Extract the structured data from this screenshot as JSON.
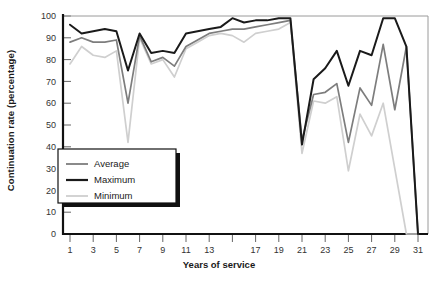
{
  "chart_data": {
    "type": "line",
    "title": "",
    "xlabel": "Years of service",
    "ylabel": "Continuation rate (percentage)",
    "xlim": [
      0,
      32
    ],
    "ylim": [
      0,
      100
    ],
    "grid": false,
    "legend_position": "inside-lower-left",
    "y_ticks": [
      0,
      10,
      20,
      30,
      40,
      50,
      60,
      70,
      80,
      90,
      100
    ],
    "y_tick_labels": [
      "0",
      "10",
      "20",
      "30",
      "40",
      "50",
      "60",
      "70",
      "80",
      "90",
      "100"
    ],
    "x_ticks": [
      1,
      3,
      5,
      7,
      9,
      11,
      13,
      15,
      17,
      19,
      21,
      23,
      25,
      27,
      29,
      31
    ],
    "x_tick_labels": [
      "1",
      "3",
      "5",
      "7",
      "9",
      "11",
      "13",
      "",
      "17",
      "19",
      "21",
      "23",
      "25",
      "27",
      "29",
      "31"
    ],
    "x": [
      1,
      2,
      3,
      4,
      5,
      6,
      7,
      8,
      9,
      10,
      11,
      12,
      13,
      14,
      15,
      16,
      17,
      18,
      19,
      20,
      21,
      22,
      23,
      24,
      25,
      26,
      27,
      28,
      29,
      30,
      31
    ],
    "series": [
      {
        "name": "Average",
        "color": "#7d7d7d",
        "values": [
          88,
          90,
          88,
          88,
          89,
          60,
          91,
          79,
          81,
          77,
          86,
          89,
          92,
          93,
          94,
          94,
          95,
          96,
          97,
          98,
          43,
          64,
          65,
          69,
          42,
          67,
          59,
          87,
          57,
          86,
          0
        ]
      },
      {
        "name": "Maximum",
        "color": "#1a1a1a",
        "values": [
          96,
          92,
          93,
          94,
          93,
          75,
          92,
          83,
          84,
          83,
          92,
          93,
          94,
          95,
          99,
          97,
          98,
          98,
          99,
          99,
          41,
          71,
          76,
          84,
          68,
          84,
          82,
          99,
          99,
          86,
          0
        ]
      },
      {
        "name": "Minimum",
        "color": "#cfcfcf",
        "values": [
          78,
          86,
          82,
          81,
          84,
          42,
          90,
          78,
          80,
          72,
          85,
          88,
          91,
          92,
          91,
          88,
          92,
          93,
          94,
          97,
          37,
          61,
          60,
          63,
          29,
          55,
          45,
          60,
          30,
          0,
          0
        ]
      }
    ]
  },
  "legend": {
    "items": [
      {
        "label": "Average"
      },
      {
        "label": "Maximum"
      },
      {
        "label": "Minimum"
      }
    ]
  }
}
